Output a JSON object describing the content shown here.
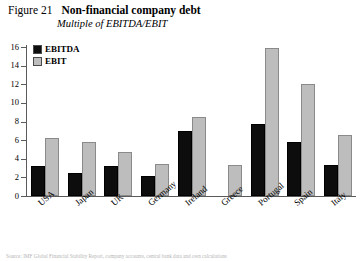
{
  "figure": {
    "number": "Figure 21",
    "title": "Non-financial company debt",
    "subtitle": "Multiple of EBITDA/EBIT"
  },
  "legend": {
    "position": "top-left-inside",
    "items": [
      {
        "label": "EBITDA",
        "color": "#0d0d0d"
      },
      {
        "label": "EBIT",
        "color": "#bdbdbd"
      }
    ]
  },
  "axis": {
    "y_ticks": [
      "0",
      "2",
      "4",
      "6",
      "8",
      "10",
      "12",
      "14",
      "16"
    ],
    "y_min": 0,
    "y_max": 16
  },
  "source_note": "Source: IMF Global Financial Stability Report, company accounts, central bank data and own calculations",
  "chart_data": {
    "type": "bar",
    "title": "Non-financial company debt",
    "subtitle": "Multiple of EBITDA/EBIT",
    "xlabel": "",
    "ylabel": "",
    "ylim": [
      0,
      16
    ],
    "yticks": [
      0,
      2,
      4,
      6,
      8,
      10,
      12,
      14,
      16
    ],
    "grid": false,
    "legend_position": "upper left",
    "categories": [
      "USA",
      "Japan",
      "UK",
      "Germany",
      "Ireland",
      "Greece",
      "Portugal",
      "Spain",
      "Italy"
    ],
    "series": [
      {
        "name": "EBITDA",
        "color": "#0d0d0d",
        "values": [
          3.2,
          2.5,
          3.2,
          2.1,
          7.0,
          null,
          7.7,
          5.8,
          3.3
        ]
      },
      {
        "name": "EBIT",
        "color": "#bdbdbd",
        "values": [
          6.2,
          5.8,
          4.7,
          3.4,
          8.5,
          3.3,
          15.9,
          12.0,
          6.5
        ]
      }
    ]
  }
}
